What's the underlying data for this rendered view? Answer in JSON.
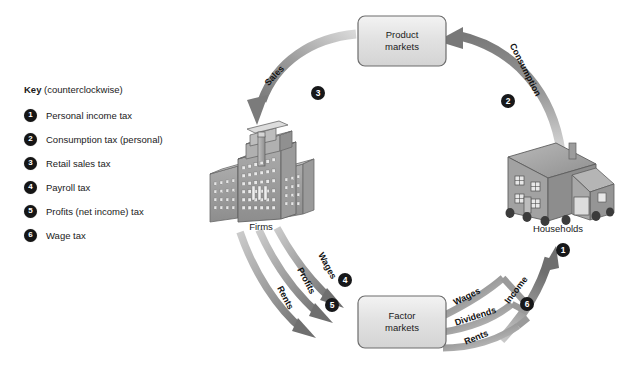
{
  "figure": {
    "type": "circular-flow-diagram"
  },
  "key": {
    "heading_bold": "Key",
    "heading_rest": "(counterclockwise)",
    "items": [
      {
        "num": "1",
        "label": "Personal income tax"
      },
      {
        "num": "2",
        "label": "Consumption tax (personal)"
      },
      {
        "num": "3",
        "label": "Retail sales tax"
      },
      {
        "num": "4",
        "label": "Payroll tax"
      },
      {
        "num": "5",
        "label": "Profits (net income) tax"
      },
      {
        "num": "6",
        "label": "Wage tax"
      }
    ]
  },
  "nodes": {
    "product_markets": {
      "line1": "Product",
      "line2": "markets"
    },
    "factor_markets": {
      "line1": "Factor",
      "line2": "markets"
    },
    "firms": {
      "label": "Firms"
    },
    "households": {
      "label": "Households"
    }
  },
  "flows": {
    "sales": {
      "label": "Sales",
      "badge": "3"
    },
    "consumption": {
      "label": "Consumption",
      "badge": "2"
    },
    "income": {
      "label": "Income",
      "badge": "6"
    },
    "personal_income": {
      "badge": "1"
    },
    "firm_to_factor": [
      {
        "label": "Wages",
        "badge": "4"
      },
      {
        "label": "Profits",
        "badge": "5"
      },
      {
        "label": "Rents",
        "badge": ""
      }
    ],
    "household_to_factor": [
      {
        "label": "Wages"
      },
      {
        "label": "Dividends"
      },
      {
        "label": "Rents"
      }
    ]
  },
  "colors": {
    "arrow_gray": "#8e8e8e",
    "arrow_gray_dark": "#6f6f6f",
    "arrow_gray_light": "#cfcfcf",
    "badge_black": "#17181a",
    "box_fill": "#e4e4e4",
    "box_border": "#6d6d6d",
    "building_gray": "#a8a8a8",
    "text": "#1a1a1a"
  }
}
